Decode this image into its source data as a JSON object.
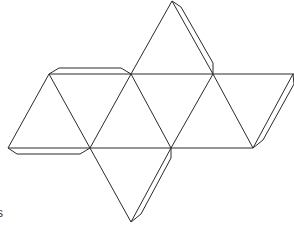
{
  "figure": {
    "stroke_color": "#2a2a2a",
    "background": "#ffffff",
    "edge_fragment_text": "s"
  },
  "geometry": {
    "vertices": {
      "apex_top": [
        172,
        1
      ],
      "t1": [
        49,
        74
      ],
      "t2": [
        131,
        74
      ],
      "t3": [
        213,
        74
      ],
      "t4": [
        293,
        74
      ],
      "b1": [
        8,
        148
      ],
      "b2": [
        90,
        148
      ],
      "b3": [
        171,
        148
      ],
      "b4": [
        253,
        148
      ],
      "apex_bottom": [
        131,
        222
      ]
    },
    "faces": 8,
    "tabs": 4
  }
}
